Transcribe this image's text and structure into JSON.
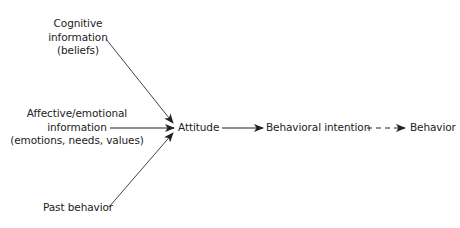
{
  "diagram": {
    "inputs": {
      "cognitive": {
        "lines": [
          "Cognitive",
          "information",
          "(beliefs)"
        ]
      },
      "affective": {
        "lines": [
          "Affective/emotional",
          "information",
          "(emotions, needs, values)"
        ]
      },
      "past": {
        "lines": [
          "Past behavior"
        ]
      }
    },
    "chain": {
      "attitude": "Attitude",
      "intention": "Behavioral intention",
      "behavior": "Behavior"
    },
    "edges": [
      {
        "from": "Cognitive information (beliefs)",
        "to": "Attitude",
        "style": "solid"
      },
      {
        "from": "Affective/emotional information (emotions, needs, values)",
        "to": "Attitude",
        "style": "solid"
      },
      {
        "from": "Past behavior",
        "to": "Attitude",
        "style": "solid"
      },
      {
        "from": "Attitude",
        "to": "Behavioral intention",
        "style": "solid"
      },
      {
        "from": "Behavioral intention",
        "to": "Behavior",
        "style": "dashed"
      }
    ],
    "colors": {
      "line": "#333333",
      "text": "#222222"
    }
  }
}
